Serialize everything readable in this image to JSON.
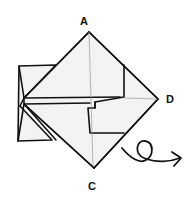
{
  "diagram": {
    "type": "origami-fold-step",
    "labels": {
      "top": "A",
      "right": "D",
      "bottom": "C"
    },
    "symbols": {
      "turn_over_arrow": "turn-over-icon"
    },
    "colors": {
      "line": "#111111",
      "paper": "#f3f3f3",
      "crease": "#9a9a9a",
      "background": "#ffffff"
    }
  }
}
